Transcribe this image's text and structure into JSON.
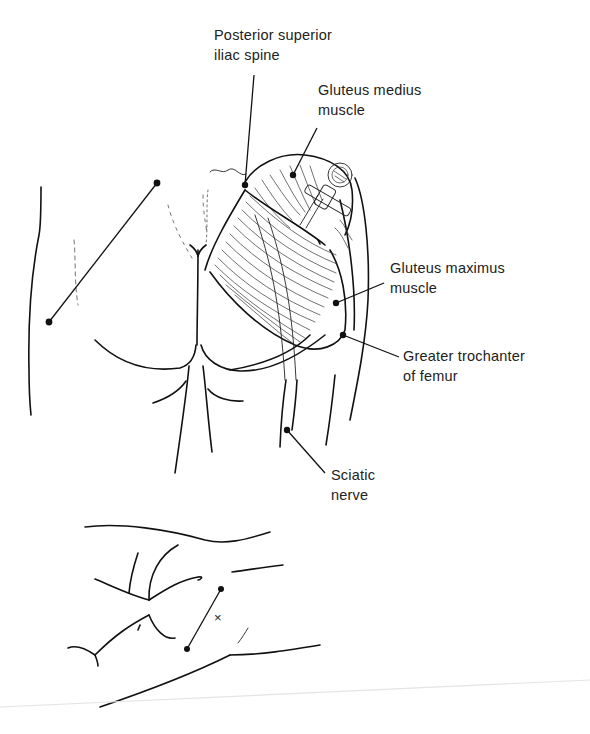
{
  "figure": {
    "labels": {
      "psis": {
        "line1": "Posterior superior",
        "line2": "iliac spine"
      },
      "gluteus_medius": {
        "line1": "Gluteus medius",
        "line2": "muscle"
      },
      "gluteus_maximus": {
        "line1": "Gluteus maximus",
        "line2": "muscle"
      },
      "greater_trochanter": {
        "line1": "Greater trochanter",
        "line2": "of femur"
      },
      "sciatic_nerve": {
        "line1": "Sciatic",
        "line2": "nerve"
      }
    },
    "inset": {
      "marker": "×"
    },
    "colors": {
      "ink": "#111111",
      "label_text": "#222222",
      "background": "#ffffff"
    }
  }
}
